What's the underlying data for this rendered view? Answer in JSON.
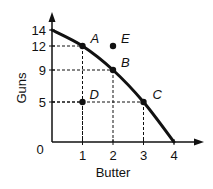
{
  "chart_data": {
    "type": "line",
    "title": "",
    "xlabel": "Butter",
    "ylabel": "Guns",
    "xlim": [
      0,
      4
    ],
    "ylim": [
      0,
      14
    ],
    "x_ticks": [
      0,
      1,
      2,
      3,
      4
    ],
    "y_ticks": [
      0,
      5,
      9,
      12,
      14
    ],
    "x_tick_labels": [
      "1",
      "2",
      "3",
      "4"
    ],
    "y_tick_labels": [
      "14",
      "12",
      "9",
      "5"
    ],
    "origin_label": "0",
    "grid": false,
    "series": [
      {
        "name": "Production Possibilities Frontier",
        "x": [
          0,
          1,
          2,
          3,
          4
        ],
        "y": [
          14,
          12,
          9,
          5,
          0
        ]
      }
    ],
    "points": [
      {
        "label": "A",
        "x": 1,
        "y": 12,
        "on_curve": true
      },
      {
        "label": "B",
        "x": 2,
        "y": 9,
        "on_curve": true
      },
      {
        "label": "C",
        "x": 3,
        "y": 5,
        "on_curve": true
      },
      {
        "label": "D",
        "x": 1,
        "y": 5,
        "on_curve": false
      },
      {
        "label": "E",
        "x": 2,
        "y": 12,
        "on_curve": false
      }
    ],
    "guide_lines": "dashed lines from points A, B, C, D to both axes"
  },
  "colors": {
    "ink": "#111111",
    "background": "#ffffff"
  }
}
